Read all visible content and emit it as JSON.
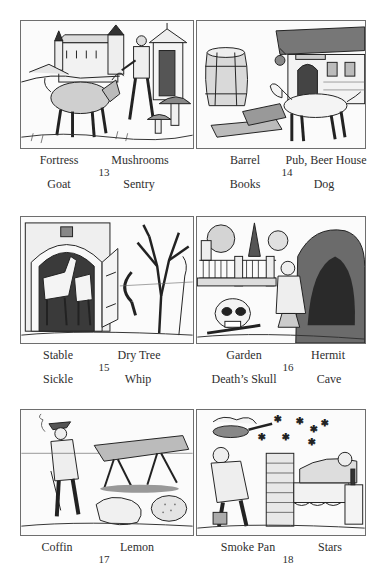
{
  "cards": [
    {
      "number": "13",
      "labels": {
        "top_left": "Fortress",
        "top_right": "Mushrooms",
        "bottom_left": "Goat",
        "bottom_right": "Sentry"
      },
      "illustration": "fortress-goat-sentry-mushrooms-illustration"
    },
    {
      "number": "14",
      "labels": {
        "top_left": "Barrel",
        "top_right": "Pub, Beer House",
        "bottom_left": "Books",
        "bottom_right": "Dog"
      },
      "illustration": "barrel-books-pub-dog-illustration"
    },
    {
      "number": "15",
      "labels": {
        "top_left": "Stable",
        "top_right": "Dry Tree",
        "bottom_left": "Sickle",
        "bottom_right": "Whip"
      },
      "illustration": "stable-sickle-dry-tree-whip-illustration"
    },
    {
      "number": "16",
      "labels": {
        "top_left": "Garden",
        "top_right": "Hermit",
        "bottom_left": "Death’s Skull",
        "bottom_right": "Cave"
      },
      "illustration": "garden-skull-hermit-cave-illustration"
    },
    {
      "number": "17",
      "labels": {
        "top_left": "Coffin",
        "top_right": "Lemon"
      },
      "illustration": "coffin-lemon-illustration"
    },
    {
      "number": "18",
      "labels": {
        "top_left": "Smoke Pan",
        "top_right": "Stars"
      },
      "illustration": "smoke-pan-stars-illustration"
    }
  ]
}
